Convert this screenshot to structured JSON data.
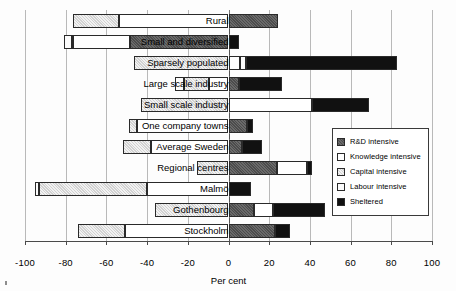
{
  "chart_data": {
    "type": "bar",
    "orientation": "horizontal",
    "subtype": "diverging-stacked",
    "title": "",
    "xlabel": "Per cent",
    "ylabel": "",
    "xlim": [
      -100,
      100
    ],
    "xticks": [
      -100,
      -80,
      -60,
      -40,
      -20,
      0,
      20,
      40,
      60,
      80,
      100
    ],
    "xticklabels": [
      "-100",
      "-80",
      "-60",
      "-40",
      "-20",
      "0",
      "20",
      "40",
      "60",
      "80",
      "100"
    ],
    "grid": true,
    "legend_position": "right-inside",
    "categories": [
      "Rural",
      "Small and diversified",
      "Sparsely populated",
      "Large scale industry",
      "Small scale industry",
      "One company towns",
      "Average Sweden",
      "Regional centres",
      "Malmö",
      "Gothenbourg",
      "Stockholm"
    ],
    "series": [
      {
        "name": "R&D intensive",
        "color": "#5a5a5a",
        "values": [
          24.5,
          -48.5,
          0,
          5.0,
          0,
          9.0,
          6.5,
          24.0,
          0,
          12.5,
          23.0
        ]
      },
      {
        "name": "Knowledge intensive",
        "color": "#ffffff",
        "values": [
          -54.0,
          -28.0,
          5.5,
          -9.5,
          41.0,
          -45.0,
          -38.0,
          14.5,
          -40.0,
          9.5,
          -51.0
        ]
      },
      {
        "name": "Capital intensive",
        "color": "#e3e3e3",
        "values": [
          -22.5,
          -0.5,
          -46.5,
          -12.5,
          -43.0,
          -4.0,
          -14.0,
          -15.5,
          -53.0,
          -36.0,
          -23.0
        ]
      },
      {
        "name": "Labour intensive",
        "color": "#fbfbfb",
        "values": [
          0,
          -4.0,
          3.0,
          -4.5,
          0,
          0,
          0,
          0,
          -2.0,
          0,
          0
        ]
      },
      {
        "name": "Sheltered",
        "color": "#111111",
        "values": [
          0,
          5.0,
          74.5,
          21.5,
          28.0,
          3.0,
          10.0,
          2.5,
          11.0,
          25.5,
          7.0
        ]
      }
    ]
  },
  "legend": {
    "items": [
      {
        "label": "R&D intensive",
        "swatch": "sw-rd"
      },
      {
        "label": "Knowledge intensive",
        "swatch": "sw-know"
      },
      {
        "label": "Capital intensive",
        "swatch": "sw-cap"
      },
      {
        "label": "Labour intensive",
        "swatch": "sw-lab"
      },
      {
        "label": "Sheltered",
        "swatch": "sw-shel"
      }
    ]
  }
}
